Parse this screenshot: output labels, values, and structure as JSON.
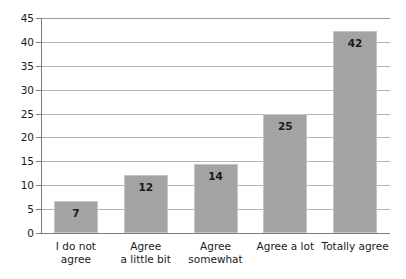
{
  "chart_data": {
    "type": "bar",
    "title": "",
    "xlabel": "",
    "ylabel": "",
    "categories": [
      "I do not agree",
      "Agree\na little bit",
      "Agree\nsomewhat",
      "Agree a lot",
      "Totally agree"
    ],
    "values": [
      7,
      12,
      14,
      25,
      42
    ],
    "bar_heights": [
      6.6,
      12.2,
      14.4,
      24.9,
      42.2
    ],
    "data_labels": [
      "7",
      "12",
      "14",
      "25",
      "42"
    ],
    "ylim": [
      0,
      45
    ],
    "ytick_labels": [
      "0",
      "5",
      "10",
      "15",
      "20",
      "25",
      "30",
      "35",
      "40",
      "45"
    ],
    "ytick_values": [
      0,
      5,
      10,
      15,
      20,
      25,
      30,
      35,
      40,
      45
    ],
    "grid": true,
    "legend": "none",
    "bar_color": "#a3a3a3",
    "bar_border_color": "#c6c6c6",
    "gridline_color": "#b5b5b5",
    "axis_color": "#7d7d7d",
    "text_color": "#1a1a1a",
    "background": "#ffffff"
  }
}
